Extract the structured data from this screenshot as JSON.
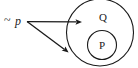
{
  "figure": {
    "background_color": "#ffffff",
    "ink_color": "#1a1a1a",
    "width": 138,
    "height": 68
  },
  "labels": {
    "negation_symbol": "~",
    "antecedent": "p",
    "outer_set": "Q",
    "inner_set": "P"
  },
  "sets": {
    "outer": {
      "name": "Q",
      "center_x": 100,
      "center_y": 32.5,
      "radius": 33.5
    },
    "inner": {
      "name": "P",
      "center_x": 102,
      "center_y": 45,
      "radius": 14.5
    }
  },
  "arrows": [
    {
      "name": "arrow-to-outer-region",
      "from_x": 27,
      "from_y": 21.5,
      "to_x": 82,
      "to_y": 22
    },
    {
      "name": "arrow-to-exterior-region",
      "from_x": 27,
      "from_y": 21.5,
      "to_x": 68,
      "to_y": 52
    }
  ]
}
